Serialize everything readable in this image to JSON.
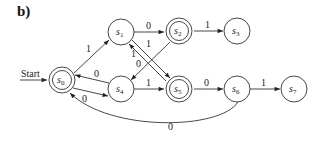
{
  "figure": {
    "label": "b)",
    "start_label": "Start"
  },
  "diagram": {
    "type": "finite-state-machine",
    "start_state": "s0",
    "states": [
      {
        "id": "s0",
        "name": "s",
        "sub": "0",
        "accepting": true,
        "x": 62,
        "y": 80
      },
      {
        "id": "s1",
        "name": "s",
        "sub": "1",
        "accepting": false,
        "x": 121,
        "y": 32
      },
      {
        "id": "s2",
        "name": "s",
        "sub": "2",
        "accepting": true,
        "x": 179,
        "y": 31
      },
      {
        "id": "s3",
        "name": "s",
        "sub": "3",
        "accepting": false,
        "x": 237,
        "y": 31
      },
      {
        "id": "s4",
        "name": "s",
        "sub": "4",
        "accepting": false,
        "x": 121,
        "y": 89
      },
      {
        "id": "s5",
        "name": "s",
        "sub": "5",
        "accepting": true,
        "x": 179,
        "y": 89
      },
      {
        "id": "s6",
        "name": "s",
        "sub": "6",
        "accepting": false,
        "x": 237,
        "y": 89
      },
      {
        "id": "s7",
        "name": "s",
        "sub": "7",
        "accepting": false,
        "x": 294,
        "y": 89
      }
    ],
    "transitions": [
      {
        "from": "s0",
        "to": "s1",
        "label": "1"
      },
      {
        "from": "s0",
        "to": "s4",
        "label": "0"
      },
      {
        "from": "s4",
        "to": "s0",
        "label": "0"
      },
      {
        "from": "s1",
        "to": "s2",
        "label": "0"
      },
      {
        "from": "s1",
        "to": "s5",
        "label": "1"
      },
      {
        "from": "s5",
        "to": "s1",
        "label": "1"
      },
      {
        "from": "s2",
        "to": "s3",
        "label": "1"
      },
      {
        "from": "s2",
        "to": "s4",
        "label": "0"
      },
      {
        "from": "s4",
        "to": "s5",
        "label": "1"
      },
      {
        "from": "s5",
        "to": "s6",
        "label": "0"
      },
      {
        "from": "s6",
        "to": "s7",
        "label": "1"
      },
      {
        "from": "s6",
        "to": "s0",
        "label": "0"
      }
    ]
  }
}
